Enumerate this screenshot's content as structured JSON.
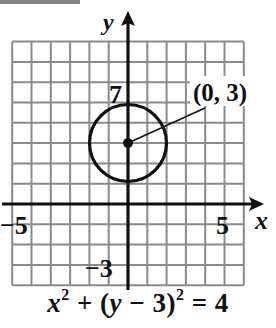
{
  "chart_data": {
    "type": "scatter",
    "title": "",
    "equation": {
      "text": "x^2 + (y - 3)^2 = 4",
      "parts": [
        "x",
        "2",
        " + (",
        "y",
        " − 3)",
        "2",
        " = 4"
      ]
    },
    "xlabel": "x",
    "ylabel": "y",
    "xlim": [
      -6,
      6
    ],
    "ylim": [
      -4,
      8
    ],
    "grid": true,
    "x_tick_labels": [
      {
        "value": -5,
        "label": "−5"
      },
      {
        "value": 5,
        "label": "5"
      }
    ],
    "y_tick_labels": [
      {
        "value": 7,
        "label": "7"
      },
      {
        "value": -3,
        "label": "−3"
      }
    ],
    "shapes": [
      {
        "shape": "circle",
        "center": [
          0,
          3
        ],
        "radius": 2
      }
    ],
    "points": [
      {
        "x": 0,
        "y": 3,
        "label": "(0, 3)"
      }
    ],
    "annotations": [
      {
        "text": "(0, 3)",
        "points_to": [
          0,
          3
        ]
      }
    ]
  },
  "labels": {
    "x_axis": "x",
    "y_axis": "y",
    "tick_neg5": "−5",
    "tick_5": "5",
    "tick_7": "7",
    "tick_neg3": "−3",
    "center_label": "(0, 3)",
    "eq_x": "x",
    "eq_exp1": "2",
    "eq_mid": " + (",
    "eq_y": "y",
    "eq_minus": " − 3)",
    "eq_exp2": "2",
    "eq_end": " = 4"
  },
  "colors": {
    "grid": "#8a8a8a",
    "axis": "#111111",
    "curve": "#111111"
  }
}
